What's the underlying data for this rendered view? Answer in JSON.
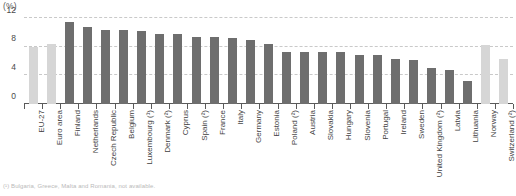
{
  "units_label": "(%)",
  "footnote": "(¹) Bulgaria, Greece, Malta and Romania, not available.",
  "colors": {
    "aggregate_bar": "#d6d6d6",
    "country_bar": "#6e6e6e",
    "gridline": "#c9c9c9",
    "axis": "#5a5a5a",
    "text": "#3f3f3f"
  },
  "chart_data": {
    "type": "bar",
    "title": "",
    "subtitle": "",
    "xlabel": "",
    "ylabel": "(%)",
    "ylim": [
      0,
      12
    ],
    "yticks": [
      0,
      4,
      8,
      12
    ],
    "grid": true,
    "legend": "none",
    "categories": [
      "EU-27",
      "Euro area",
      "Finland",
      "Netherlands",
      "Czech Republic",
      "Belgium",
      "Luxembourg (¹)",
      "Denmark (²)",
      "Cyprus",
      "Spain (²)",
      "France",
      "Italy",
      "Germany",
      "Estonia",
      "Poland (²)",
      "Austria",
      "Slovakia",
      "Hungary",
      "Slovenia",
      "Portugal",
      "Ireland",
      "Sweden",
      "United Kingdom (²)",
      "Latvia",
      "Lithuania",
      "Norway",
      "Switzerland (²)"
    ],
    "values": [
      8.0,
      8.4,
      11.4,
      10.8,
      10.3,
      10.3,
      10.2,
      9.8,
      9.7,
      9.4,
      9.3,
      9.2,
      9.0,
      8.4,
      7.3,
      7.3,
      7.2,
      7.2,
      6.9,
      6.8,
      6.3,
      6.1,
      5.0,
      4.8,
      3.2,
      8.2,
      6.3
    ],
    "series_kind": [
      "aggregate",
      "aggregate",
      "country",
      "country",
      "country",
      "country",
      "country",
      "country",
      "country",
      "country",
      "country",
      "country",
      "country",
      "country",
      "country",
      "country",
      "country",
      "country",
      "country",
      "country",
      "country",
      "country",
      "country",
      "country",
      "country",
      "aggregate",
      "aggregate"
    ]
  }
}
